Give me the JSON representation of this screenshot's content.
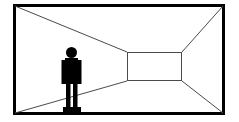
{
  "canvas": {
    "width": 239,
    "height": 122,
    "background_color": "#ffffff"
  },
  "illustration": {
    "title": "One-point perspective room with standing human figure",
    "style": "line-drawing",
    "line_color": "#4a4a4a",
    "frame_color": "#000000",
    "figure_color": "#000000"
  },
  "outer_frame": {
    "name": "room-opening-frame",
    "x": 13,
    "y": 4,
    "width": 212,
    "height": 111,
    "stroke_width": 3,
    "fill": "none",
    "color": "#000000"
  },
  "back_wall": {
    "name": "back-wall-rectangle",
    "x": 127,
    "y": 52,
    "width": 55,
    "height": 29,
    "stroke_width": 1,
    "fill": "#ffffff",
    "color": "#4a4a4a"
  },
  "perspective_lines": [
    {
      "name": "ceiling-line-left",
      "from": [
        15,
        6
      ],
      "to": [
        127,
        52
      ]
    },
    {
      "name": "ceiling-line-right",
      "from": [
        223,
        6
      ],
      "to": [
        182,
        52
      ]
    },
    {
      "name": "floor-line-left",
      "from": [
        15,
        113
      ],
      "to": [
        127,
        81
      ]
    },
    {
      "name": "floor-line-right",
      "from": [
        223,
        113
      ],
      "to": [
        182,
        81
      ]
    }
  ],
  "figure": {
    "name": "human-silhouette",
    "color": "#000000",
    "parts": {
      "head": {
        "cx": 71.5,
        "cy": 52.5,
        "r": 5.5
      },
      "torso": {
        "x": 65,
        "y": 58,
        "width": 13,
        "height": 26
      },
      "arm_left": {
        "x": 61.5,
        "y": 60,
        "width": 3.5,
        "height": 24
      },
      "arm_right": {
        "x": 78,
        "y": 60,
        "width": 3.5,
        "height": 24
      },
      "leg_left": {
        "x": 66,
        "y": 84,
        "width": 4.5,
        "height": 24
      },
      "leg_right": {
        "x": 73,
        "y": 84,
        "width": 4.5,
        "height": 24
      },
      "base": {
        "x": 63,
        "y": 107,
        "width": 18,
        "height": 5
      }
    }
  }
}
